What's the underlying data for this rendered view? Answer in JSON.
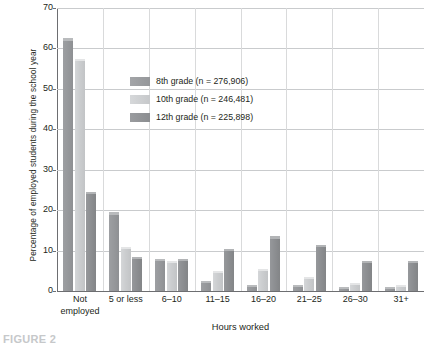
{
  "chart_data": {
    "type": "bar",
    "title": "",
    "xlabel": "Hours worked",
    "ylabel": "Percentage of employed students during the school year",
    "categories": [
      "Not employed",
      "5 or less",
      "6–10",
      "11–15",
      "16–20",
      "21–25",
      "26–30",
      "31+"
    ],
    "category_lines": [
      [
        "Not",
        "employed"
      ],
      [
        "5 or less"
      ],
      [
        "6–10"
      ],
      [
        "11–15"
      ],
      [
        "16–20"
      ],
      [
        "21–25"
      ],
      [
        "26–30"
      ],
      [
        "31+"
      ]
    ],
    "series": [
      {
        "name": "8th grade (n = 276,906)",
        "color": "#97999c",
        "values": [
          62,
          19,
          7.5,
          2,
          1,
          1,
          0.5,
          0.5
        ]
      },
      {
        "name": "10th grade (n = 246,481)",
        "color": "#cbcdcf",
        "values": [
          57,
          10.5,
          7,
          4.5,
          5,
          3,
          1.5,
          1
        ]
      },
      {
        "name": "12th grade (n = 225,898)",
        "color": "#8d8f92",
        "values": [
          24,
          8,
          7.5,
          10,
          13,
          11,
          7,
          7
        ]
      }
    ],
    "ylim": [
      0,
      70
    ],
    "yticks": [
      0,
      10,
      20,
      30,
      40,
      50,
      60,
      70
    ],
    "ytick_labels": [
      "0",
      "10",
      "20",
      "30",
      "40",
      "50",
      "60",
      "70"
    ],
    "grid": true,
    "legend_position": "inside-upper-left"
  },
  "legend": {
    "items": [
      {
        "label": "8th grade (n = 276,906)"
      },
      {
        "label": "10th grade (n = 246,481)"
      },
      {
        "label": "12th grade (n = 225,898)"
      }
    ]
  },
  "caption": {
    "text": "FIGURE 2"
  }
}
